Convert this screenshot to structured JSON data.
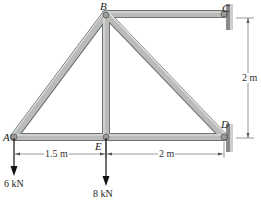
{
  "figure": {
    "type": "truss",
    "joints": {
      "A": {
        "label": "A"
      },
      "B": {
        "label": "B"
      },
      "C": {
        "label": "C"
      },
      "D": {
        "label": "D"
      },
      "E": {
        "label": "E"
      }
    },
    "members": [
      "AB",
      "BE",
      "BD",
      "BC",
      "AE",
      "ED"
    ],
    "supports": [
      {
        "joint": "C",
        "type": "pin-wall"
      },
      {
        "joint": "D",
        "type": "pin-wall"
      }
    ],
    "loads": [
      {
        "joint": "A",
        "label": "6 kN",
        "direction": "down"
      },
      {
        "joint": "E",
        "label": "8 kN",
        "direction": "down"
      }
    ],
    "dimensions": [
      {
        "from": "A",
        "to": "E",
        "label": "1.5 m"
      },
      {
        "from": "E",
        "to": "D",
        "label": "2 m"
      },
      {
        "from": "C",
        "to": "D",
        "label": "2 m"
      }
    ],
    "colors": {
      "member_fill": "#b9bcb8",
      "member_edge": "#6f736f",
      "wall": "#7a7a7a",
      "arrow": "#111111"
    }
  }
}
